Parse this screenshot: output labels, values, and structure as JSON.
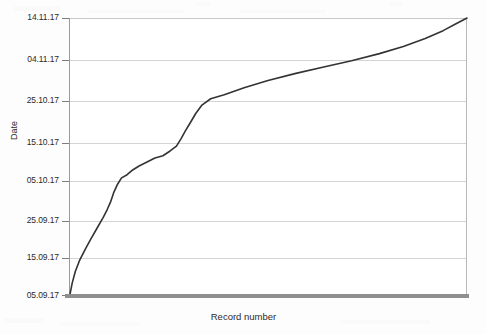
{
  "chart_data": {
    "type": "line",
    "title": "",
    "subtitle": "",
    "xlabel": "Record number",
    "ylabel": "Date",
    "grid": true,
    "legend": null,
    "legend_position": "none",
    "line_color": "#333333",
    "gridline_color": "#d4d4d4",
    "axis_color": "#8f8f8f",
    "background_color": "#ffffff",
    "y_tick_labels": [
      "14.11.17",
      "04.11.17",
      "25.10.17",
      "15.10.17",
      "05.10.17",
      "25.09.17",
      "15.09.17",
      "05.09.17"
    ],
    "y_tick_values": [
      70,
      60,
      50,
      40,
      30,
      20,
      10,
      0
    ],
    "ylim": [
      0,
      70
    ],
    "ylim_labels": [
      "05.09.17",
      "14.11.17"
    ],
    "xlim": [
      0,
      100
    ],
    "x_tick_labels": [],
    "x": [
      0.3,
      0.8,
      1.6,
      2.6,
      4.0,
      5.4,
      7.0,
      8.6,
      9.6,
      10.4,
      11.2,
      12.2,
      13.2,
      14.6,
      16.0,
      17.6,
      19.6,
      21.6,
      23.6,
      25.4,
      27.0,
      28.2,
      29.2,
      30.4,
      31.8,
      33.4,
      35.6,
      39.0,
      44.0,
      50.0,
      57.0,
      64.0,
      71.0,
      78.0,
      84.0,
      89.5,
      94.0,
      97.0,
      100.0
    ],
    "y": [
      0.4,
      3.0,
      6.0,
      8.6,
      11.4,
      14.0,
      16.8,
      19.6,
      21.6,
      23.4,
      25.8,
      28.0,
      29.6,
      30.4,
      31.6,
      32.6,
      33.6,
      34.6,
      35.2,
      36.4,
      37.6,
      39.6,
      41.4,
      43.4,
      45.8,
      48.0,
      49.6,
      50.6,
      52.4,
      54.2,
      56.0,
      57.6,
      59.2,
      61.0,
      62.8,
      64.8,
      66.8,
      68.4,
      70.0
    ],
    "series": [
      {
        "name": "Record date",
        "color": "#333333",
        "line_width": 1.6
      }
    ]
  },
  "axes": {
    "y_title": "Date",
    "x_title": "Record number"
  }
}
